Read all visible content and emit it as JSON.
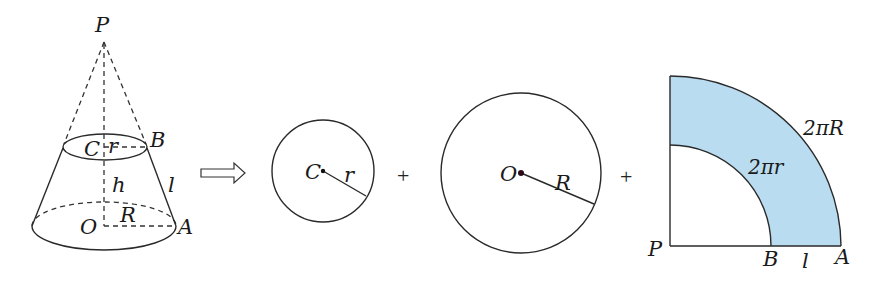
{
  "frustum": {
    "labels": {
      "apex": "P",
      "top_center": "C",
      "top_radius": "r",
      "top_point": "B",
      "height": "h",
      "slant": "l",
      "bottom_center": "O",
      "bottom_radius": "R",
      "bottom_point": "A"
    }
  },
  "arrow": {
    "symbol": "implies-arrow"
  },
  "small_circle": {
    "center_label": "C",
    "radius_label": "r"
  },
  "operators": {
    "plus_1": "+",
    "plus_2": "+"
  },
  "large_circle": {
    "center_label": "O",
    "radius_label": "R"
  },
  "sector": {
    "apex_label": "P",
    "inner_point_label": "B",
    "outer_point_label": "A",
    "slant_label": "l",
    "inner_arc_label": "2πr",
    "outer_arc_label": "2πR",
    "fill_color": "#b9dcf0"
  }
}
